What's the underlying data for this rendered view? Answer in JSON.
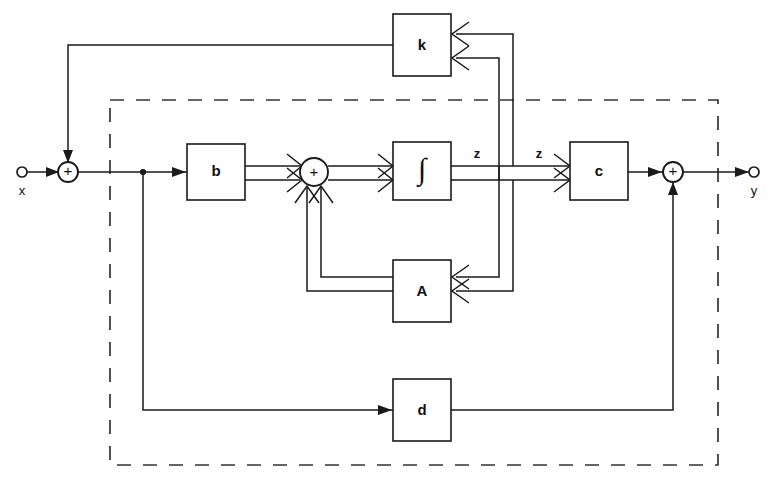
{
  "figure": {
    "kind": "control-system-block-diagram",
    "caption_partial": "",
    "colors": {
      "line": "#1a1a1a",
      "dashed_boundary": "#333333",
      "background": "#ffffff",
      "label_text": "#111111"
    }
  },
  "io": {
    "input_label": "x",
    "output_label": "y"
  },
  "blocks": [
    {
      "id": "k",
      "label": "k",
      "x": 393,
      "y": 14,
      "w": 58,
      "h": 62
    },
    {
      "id": "b",
      "label": "b",
      "x": 187,
      "y": 144,
      "w": 58,
      "h": 56
    },
    {
      "id": "integrator",
      "label": "∫",
      "x": 393,
      "y": 142,
      "w": 58,
      "h": 58
    },
    {
      "id": "c",
      "label": "c",
      "x": 570,
      "y": 142,
      "w": 58,
      "h": 58
    },
    {
      "id": "A",
      "label": "A",
      "x": 393,
      "y": 260,
      "w": 58,
      "h": 62
    },
    {
      "id": "d",
      "label": "d",
      "x": 393,
      "y": 379,
      "w": 58,
      "h": 62
    }
  ],
  "summing_junctions": [
    {
      "id": "input-sum",
      "sign": "+",
      "cx": 68,
      "cy": 172,
      "r": 10
    },
    {
      "id": "state-sum",
      "sign": "+",
      "cx": 314,
      "cy": 172,
      "r": 14
    },
    {
      "id": "output-sum",
      "sign": "+",
      "cx": 673,
      "cy": 172,
      "r": 10
    }
  ],
  "signal_labels": [
    {
      "id": "z-left",
      "text": "z",
      "x": 477,
      "y": 155
    },
    {
      "id": "z-right",
      "text": "z",
      "x": 539,
      "y": 155
    }
  ],
  "dashed_boundary": {
    "x": 110,
    "y": 100,
    "w": 608,
    "h": 365
  },
  "legend": {
    "bus_description": "double line = vector signal",
    "single_description": "single line = scalar signal"
  }
}
